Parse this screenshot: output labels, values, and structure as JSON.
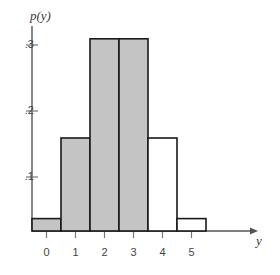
{
  "chart_data": {
    "type": "bar",
    "title": "",
    "subtitle": "",
    "xlabel": "y",
    "ylabel": "p(y)",
    "categories": [
      "0",
      "1",
      "2",
      "3",
      "4",
      "5"
    ],
    "values": [
      0.02,
      0.15,
      0.31,
      0.31,
      0.15,
      0.02
    ],
    "bar_fill": [
      "shaded",
      "shaded",
      "shaded",
      "shaded",
      "open",
      "open"
    ],
    "shaded_color": "#c4c4c4",
    "open_color": "#ffffff",
    "outline_color": "#1a1a1a",
    "axis_color": "#555555",
    "xlim": [
      -0.5,
      5.5
    ],
    "ylim": [
      0,
      0.345
    ],
    "ytick_values": [
      0.1,
      0.2,
      0.3
    ],
    "ytick_labels": [
      ".1",
      ".2",
      ".3"
    ],
    "xtick_values": [
      0,
      1,
      2,
      3,
      4,
      5
    ],
    "xtick_labels": [
      "0",
      "1",
      "2",
      "3",
      "4",
      "5"
    ],
    "grid": false,
    "legend": "none",
    "bar_width": 1,
    "annotations": []
  },
  "axes": {
    "y_axis_label": "p(y)",
    "x_axis_label": "y"
  },
  "ticks": {
    "y": [
      {
        "label": ".3",
        "value": 0.3
      },
      {
        "label": ".2",
        "value": 0.2
      },
      {
        "label": ".1",
        "value": 0.1
      }
    ],
    "x": [
      {
        "label": "0",
        "value": 0
      },
      {
        "label": "1",
        "value": 1
      },
      {
        "label": "2",
        "value": 2
      },
      {
        "label": "3",
        "value": 3
      },
      {
        "label": "4",
        "value": 4
      },
      {
        "label": "5",
        "value": 5
      }
    ]
  }
}
